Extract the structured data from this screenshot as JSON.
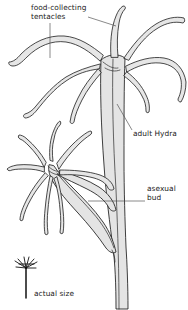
{
  "figure": {
    "subject": "hydra",
    "background_color": "#ffffff",
    "outline_color": "#1a1a1a",
    "body_fill_color": "#e3e3e3",
    "leader_line_color": "#555555",
    "width": 188,
    "height": 310
  },
  "labels": {
    "food_collecting_tentacles": {
      "line1": "food-collecting",
      "line2": "tentacles",
      "text": "food-collecting tentacles"
    },
    "adult_hydra": {
      "text": "adult Hydra"
    },
    "asexual_bud": {
      "line1": "asexual",
      "line2": "bud",
      "text": "asexual bud"
    },
    "scale_marker": {
      "text": "actual size"
    }
  },
  "parts": [
    {
      "name": "adult-hydra-body",
      "label": "adult Hydra"
    },
    {
      "name": "adult-hydra-tentacles",
      "label": "food-collecting tentacles"
    },
    {
      "name": "asexual-bud",
      "label": "asexual bud"
    },
    {
      "name": "asexual-bud-tentacles",
      "label": "food-collecting tentacles"
    },
    {
      "name": "scale-marker-hydra",
      "label": "actual size"
    }
  ]
}
